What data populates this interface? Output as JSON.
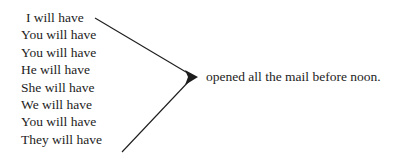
{
  "diagram": {
    "type": "sentence-pattern-converging-arrow",
    "background_color": "#ffffff",
    "text_color": "#1d1d1d",
    "subjects": [
      {
        "label": "I will have"
      },
      {
        "label": "You will have"
      },
      {
        "label": "You will have"
      },
      {
        "label": "He will have"
      },
      {
        "label": "She will have"
      },
      {
        "label": "We will have"
      },
      {
        "label": "You will have"
      },
      {
        "label": "They will have"
      }
    ],
    "predicate": {
      "label": "opened all the mail before noon."
    },
    "arrows": [
      {
        "name": "top-converging-arrow",
        "from_x": 95,
        "from_y": 18,
        "to_x": 196,
        "to_y": 77,
        "color": "#1d1d1d"
      },
      {
        "name": "bottom-converging-arrow",
        "from_x": 122,
        "from_y": 152,
        "to_x": 196,
        "to_y": 77,
        "color": "#1d1d1d"
      }
    ],
    "arrowhead": {
      "name": "arrowhead-right",
      "tip_x": 198,
      "tip_y": 77,
      "color": "#1d1d1d"
    }
  }
}
